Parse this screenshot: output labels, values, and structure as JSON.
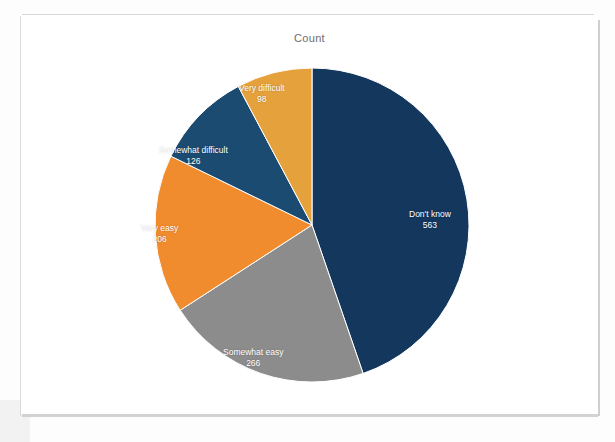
{
  "chart_title": "Count",
  "chart_data": {
    "type": "pie",
    "title": "Count",
    "xlabel": "",
    "ylabel": "",
    "total": 1259,
    "legend_position": "none",
    "grid": false,
    "start_angle_deg": 0,
    "direction": "clockwise",
    "categories": [
      "Don't know",
      "Somewhat easy",
      "Very easy",
      "Somewhat difficult",
      "Very difficult"
    ],
    "values": [
      563,
      266,
      206,
      126,
      98
    ],
    "colors": [
      "#14375E",
      "#8C8C8C",
      "#F08C2E",
      "#1B4B70",
      "#E5A13C"
    ],
    "slices": [
      {
        "label": "Don't know",
        "value": 563,
        "value_text": "563",
        "color": "#14375E",
        "start_deg": 0,
        "sweep_deg": 161.0,
        "label_left": 388,
        "label_top": 194
      },
      {
        "label": "Somewhat easy",
        "value": 266,
        "value_text": "266",
        "color": "#8C8C8C",
        "start_deg": 161.0,
        "sweep_deg": 76.1,
        "label_left": 202,
        "label_top": 332
      },
      {
        "label": "Very easy",
        "value": 206,
        "value_text": "206",
        "color": "#F08C2E",
        "start_deg": 237.1,
        "sweep_deg": 58.9,
        "label_left": 120,
        "label_top": 208
      },
      {
        "label": "Somewhat difficult",
        "value": 126,
        "value_text": "126",
        "color": "#1B4B70",
        "start_deg": 296.0,
        "sweep_deg": 36.0,
        "label_left": 138,
        "label_top": 130
      },
      {
        "label": "Very difficult",
        "value": 98,
        "value_text": "98",
        "color": "#E5A13C",
        "start_deg": 332.0,
        "sweep_deg": 28.0,
        "label_left": 218,
        "label_top": 68
      }
    ],
    "geometry": {
      "center_x": 291,
      "center_y": 210,
      "radius": 157
    }
  }
}
